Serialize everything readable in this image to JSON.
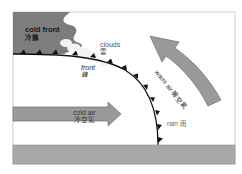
{
  "diagram": {
    "colors": {
      "frame": "#bdbdbd",
      "cold_mass": "#7d7d7d",
      "cloud": "#f2f2f2",
      "arrow_fill": "#9a9a9a",
      "arrow_stroke": "#6f6f6f",
      "front_line": "#111111",
      "ground": "#a8a8a8",
      "ground_stroke": "#8a8a8a"
    },
    "labels": {
      "cold_front": {
        "en": "cold front",
        "zh": "冷鋒"
      },
      "clouds": {
        "en": "clouds",
        "zh": "雲"
      },
      "front": {
        "en": "front",
        "zh": "鋒"
      },
      "cold_air": {
        "en": "cold air",
        "zh": "冷空氣"
      },
      "warm_air": {
        "en": "warm air 暖空氣"
      },
      "rain": {
        "en": "rain 雨"
      }
    },
    "elements": {
      "cold_air_mass": "cold-air-mass",
      "cloud_cluster": "cloud-cluster",
      "front_boundary": "front-line-with-triangle-barbs",
      "warm_air_arrow": "curved-arrow-up-left",
      "cold_air_arrow": "arrow-right",
      "ground": "ground-bar"
    }
  }
}
